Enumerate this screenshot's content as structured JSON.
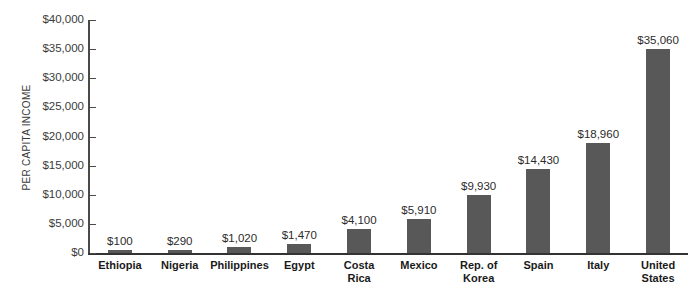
{
  "chart_data": {
    "type": "bar",
    "title": "",
    "xlabel": "",
    "ylabel": "PER CAPITA INCOME",
    "ylim": [
      0,
      40000
    ],
    "ytick_values": [
      0,
      5000,
      10000,
      15000,
      20000,
      25000,
      30000,
      35000,
      40000
    ],
    "ytick_labels": [
      "$0",
      "$5,000",
      "$10,000",
      "$15,000",
      "$20,000",
      "$25,000",
      "$30,000",
      "$35,000",
      "$40,000"
    ],
    "grid": false,
    "legend": null,
    "bar_color": "#585858",
    "axis_color": "#4a4a4a",
    "categories": [
      "Ethiopia",
      "Nigeria",
      "Philippines",
      "Egypt",
      "Costa\nRica",
      "Mexico",
      "Rep. of\nKorea",
      "Spain",
      "Italy",
      "United\nStates"
    ],
    "values": [
      100,
      290,
      1020,
      1470,
      4100,
      5910,
      9930,
      14430,
      18960,
      35060
    ],
    "value_labels": [
      "$100",
      "$290",
      "$1,020",
      "$1,470",
      "$4,100",
      "$5,910",
      "$9,930",
      "$14,430",
      "$18,960",
      "$35,060"
    ]
  }
}
